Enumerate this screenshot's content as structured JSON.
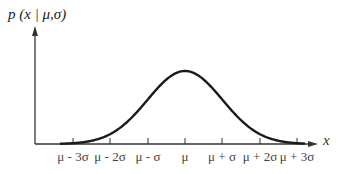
{
  "chart_data": {
    "type": "line",
    "title": "",
    "ylabel": "p(x|μ,σ)",
    "xlabel": "x",
    "curve": "normal distribution density (bell curve) centered at μ",
    "ticks": [
      "μ - 3σ",
      "μ - 2σ",
      "μ - σ",
      "μ",
      "μ + σ",
      "μ + 2σ",
      "μ + 3σ"
    ],
    "x": [
      -3,
      -2,
      -1,
      0,
      1,
      2,
      3
    ],
    "values": [
      0.0044,
      0.054,
      0.242,
      0.399,
      0.242,
      0.054,
      0.0044
    ],
    "grid": false,
    "legend": null
  },
  "labels": {
    "y_axis": "p (x | μ,σ)",
    "x_axis": "x",
    "ticks": [
      "μ - 3σ",
      "μ - 2σ",
      "μ - σ",
      "μ",
      "μ + σ",
      "μ + 2σ",
      "μ + 3σ"
    ]
  },
  "colors": {
    "curve": "#1a1a1a",
    "axis": "#333333",
    "text": "#444444"
  }
}
